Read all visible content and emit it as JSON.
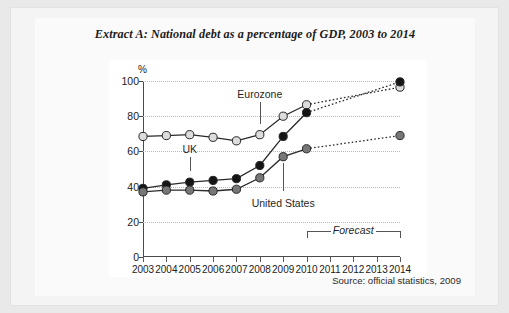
{
  "figure": {
    "title": "Extract A: National debt as a percentage of GDP, 2003 to 2014",
    "source": "Source: official statistics, 2009",
    "forecast_label": "Forecast",
    "axis_unit": "%"
  },
  "chart_data": {
    "type": "line",
    "title": "Extract A: National debt as a percentage of GDP, 2003 to 2014",
    "xlabel": "",
    "ylabel": "%",
    "ylim": [
      0,
      100
    ],
    "yticks": [
      0,
      20,
      40,
      60,
      80,
      100
    ],
    "grid": true,
    "legend": "inline-annotations",
    "categories": [
      "2003",
      "2004",
      "2005",
      "2006",
      "2007",
      "2008",
      "2009",
      "2010",
      "2011",
      "2012",
      "2013",
      "2014"
    ],
    "forecast_from": "2010",
    "annotations": [
      {
        "text": "Eurozone",
        "points_to": "2008",
        "value": 69
      },
      {
        "text": "UK",
        "points_to": "2005",
        "value": 42
      },
      {
        "text": "United States",
        "points_to": "2009",
        "value": 57
      }
    ],
    "series": [
      {
        "name": "Eurozone",
        "color": "#d9d9d9",
        "marker": "circle-light",
        "x": [
          "2003",
          "2004",
          "2005",
          "2006",
          "2007",
          "2008",
          "2009",
          "2010",
          "2014"
        ],
        "values": [
          68.5,
          69,
          69.5,
          68,
          66,
          69.5,
          80,
          86.5,
          96.5
        ]
      },
      {
        "name": "UK",
        "color": "#111111",
        "marker": "circle-dark",
        "x": [
          "2003",
          "2004",
          "2005",
          "2006",
          "2007",
          "2008",
          "2009",
          "2010",
          "2014"
        ],
        "values": [
          39,
          41,
          42.5,
          43.5,
          44.5,
          52,
          68.5,
          82,
          99.5
        ]
      },
      {
        "name": "United States",
        "color": "#6e6e6e",
        "marker": "circle-gray",
        "x": [
          "2003",
          "2004",
          "2005",
          "2006",
          "2007",
          "2008",
          "2009",
          "2010",
          "2014"
        ],
        "values": [
          37,
          38,
          38,
          37.5,
          38.5,
          45,
          57,
          61.5,
          69
        ]
      }
    ]
  }
}
